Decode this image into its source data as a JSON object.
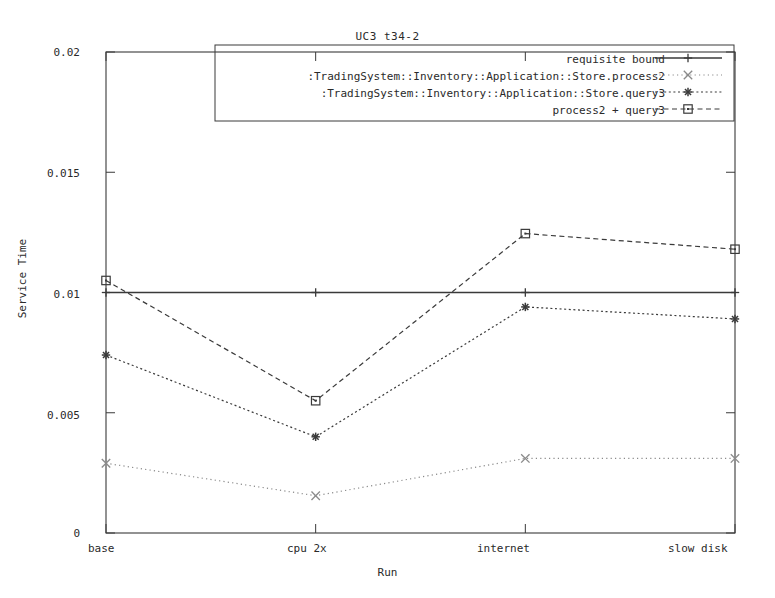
{
  "chart_data": {
    "type": "line",
    "title": "UC3 t34-2",
    "xlabel": "Run",
    "ylabel": "Service Time",
    "categories": [
      "base",
      "cpu 2x",
      "internet",
      "slow disk"
    ],
    "ylim": [
      0,
      0.02
    ],
    "yticks": [
      "0",
      "0.005",
      "0.01",
      "0.015",
      "0.02"
    ],
    "ytick_values": [
      0,
      0.005,
      0.01,
      0.015,
      0.02
    ],
    "grid": false,
    "legend_position": "top-right",
    "series": [
      {
        "name": "requisite bound",
        "marker": "plus",
        "style": "solid",
        "values": [
          0.01,
          0.01,
          0.01,
          0.01
        ]
      },
      {
        "name": ":TradingSystem::Inventory::Application::Store.process2",
        "marker": "cross",
        "style": "fine-dotted",
        "values": [
          0.0029,
          0.00155,
          0.0031,
          0.0031
        ]
      },
      {
        "name": ":TradingSystem::Inventory::Application::Store.query3",
        "marker": "star",
        "style": "dotted",
        "values": [
          0.0074,
          0.004,
          0.0094,
          0.0089
        ]
      },
      {
        "name": "process2 + query3",
        "marker": "square",
        "style": "dashed",
        "values": [
          0.0105,
          0.0055,
          0.01245,
          0.0118
        ]
      }
    ]
  }
}
